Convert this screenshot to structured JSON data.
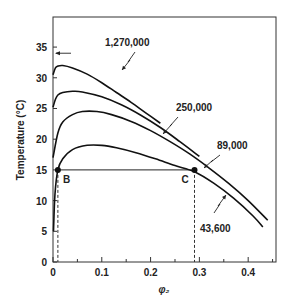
{
  "chart_data": {
    "type": "line",
    "title": "",
    "xlabel": "φ₂",
    "ylabel": "Temperature (°C)",
    "xlim": [
      0,
      0.457
    ],
    "ylim": [
      0,
      39.9
    ],
    "xticks": [
      0,
      0.1,
      0.2,
      0.3,
      0.4
    ],
    "xtick_labels": [
      "0",
      "0.1",
      "0.2",
      "0.3",
      "0.4"
    ],
    "xminor_ticks": [
      0.05,
      0.15,
      0.25,
      0.35,
      0.45
    ],
    "yticks": [
      0,
      5,
      10,
      15,
      20,
      25,
      30,
      35
    ],
    "ytick_labels": [
      "0",
      "5",
      "10",
      "15",
      "20",
      "25",
      "30",
      "35"
    ],
    "grid": false,
    "series": [
      {
        "name": "1,270,000",
        "x": [
          0.0,
          0.005,
          0.01,
          0.02,
          0.04,
          0.07,
          0.1,
          0.13,
          0.16,
          0.19,
          0.22
        ],
        "y": [
          30.5,
          31.6,
          31.9,
          32.0,
          31.6,
          30.6,
          29.2,
          27.6,
          26.0,
          24.3,
          22.6
        ]
      },
      {
        "name": "250,000",
        "x": [
          0.0,
          0.005,
          0.01,
          0.02,
          0.04,
          0.06,
          0.1,
          0.14,
          0.18,
          0.22,
          0.26,
          0.3
        ],
        "y": [
          25.2,
          26.5,
          27.2,
          27.6,
          27.8,
          27.7,
          26.9,
          25.6,
          23.9,
          21.9,
          19.6,
          17.2
        ]
      },
      {
        "name": "89,000",
        "x": [
          0.0,
          0.01,
          0.02,
          0.04,
          0.06,
          0.09,
          0.12,
          0.16,
          0.2,
          0.24,
          0.28,
          0.32,
          0.36,
          0.4,
          0.44
        ],
        "y": [
          17.0,
          21.0,
          22.8,
          24.0,
          24.5,
          24.5,
          24.0,
          22.9,
          21.4,
          19.6,
          17.6,
          15.3,
          12.8,
          10.0,
          6.8
        ],
        "end_marker": true
      },
      {
        "name": "43,600",
        "x": [
          0.001,
          0.004,
          0.01,
          0.02,
          0.04,
          0.07,
          0.1,
          0.13,
          0.17,
          0.21,
          0.25,
          0.29,
          0.33,
          0.37,
          0.41,
          0.43
        ],
        "y": [
          5.0,
          11.0,
          15.0,
          16.8,
          18.3,
          19.0,
          19.0,
          18.6,
          17.8,
          16.8,
          15.7,
          14.7,
          12.8,
          10.4,
          7.5,
          5.7
        ]
      }
    ],
    "points": [
      {
        "label": "B",
        "x": 0.01,
        "y": 15
      },
      {
        "label": "C",
        "x": 0.29,
        "y": 15
      }
    ],
    "tie_line": {
      "from": "B",
      "to": "C",
      "y": 15
    },
    "annotations": [
      {
        "text": "1,270,000",
        "series": "1,270,000"
      },
      {
        "text": "250,000",
        "series": "250,000"
      },
      {
        "text": "89,000",
        "series": "89,000"
      },
      {
        "text": "43,600",
        "series": "43,600"
      }
    ],
    "arrow_marker": {
      "x": 0.0,
      "y": 34,
      "direction": "left"
    }
  }
}
